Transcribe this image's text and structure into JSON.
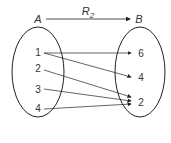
{
  "title": "R2",
  "sets": {
    "domain": {
      "label": "A",
      "elements": [
        "1",
        "2",
        "3",
        "4"
      ]
    },
    "codomain": {
      "label": "B",
      "elements": [
        "6",
        "4",
        "2"
      ]
    }
  },
  "relation": [
    {
      "from": "1",
      "to": "6"
    },
    {
      "from": "1",
      "to": "4"
    },
    {
      "from": "2",
      "to": "2"
    },
    {
      "from": "3",
      "to": "2"
    },
    {
      "from": "4",
      "to": "2"
    }
  ]
}
